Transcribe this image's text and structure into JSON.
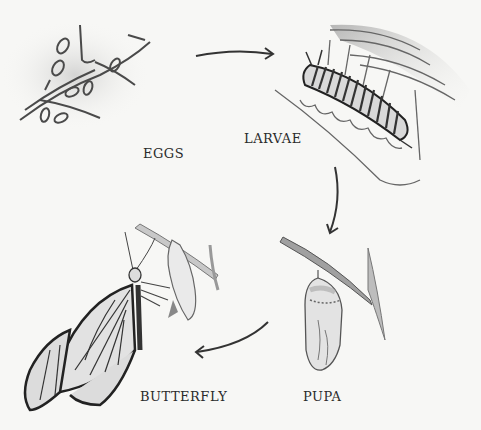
{
  "diagram": {
    "type": "life-cycle",
    "subject": "butterfly",
    "stages": [
      {
        "id": "eggs",
        "label": "EGGS"
      },
      {
        "id": "larvae",
        "label": "LARVAE"
      },
      {
        "id": "pupa",
        "label": "PUPA"
      },
      {
        "id": "butterfly",
        "label": "BUTTERFLY"
      }
    ],
    "arrows": [
      {
        "from": "eggs",
        "to": "larvae"
      },
      {
        "from": "larvae",
        "to": "pupa"
      },
      {
        "from": "pupa",
        "to": "butterfly"
      }
    ],
    "colors": {
      "background": "#f7f7f5",
      "ink": "#3a3a3a",
      "shade": "#b5b5b5"
    }
  }
}
